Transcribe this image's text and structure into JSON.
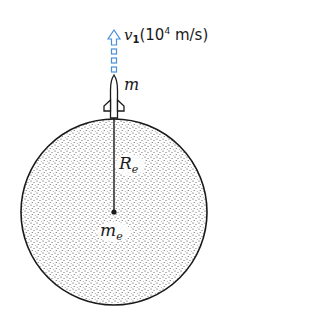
{
  "diagram": {
    "velocity_label": {
      "symbol": "v",
      "subscript": "1",
      "unit_prefix": "(10",
      "unit_exponent": "4",
      "unit_suffix": " m/s)"
    },
    "rocket_mass_label": "m",
    "radius_label": {
      "symbol": "R",
      "subscript": "e"
    },
    "earth_mass_label": {
      "symbol": "m",
      "subscript": "e"
    },
    "colors": {
      "arrow": "#4a90d9",
      "outline": "#1a1a1a",
      "fill_dots": "#333333"
    }
  }
}
